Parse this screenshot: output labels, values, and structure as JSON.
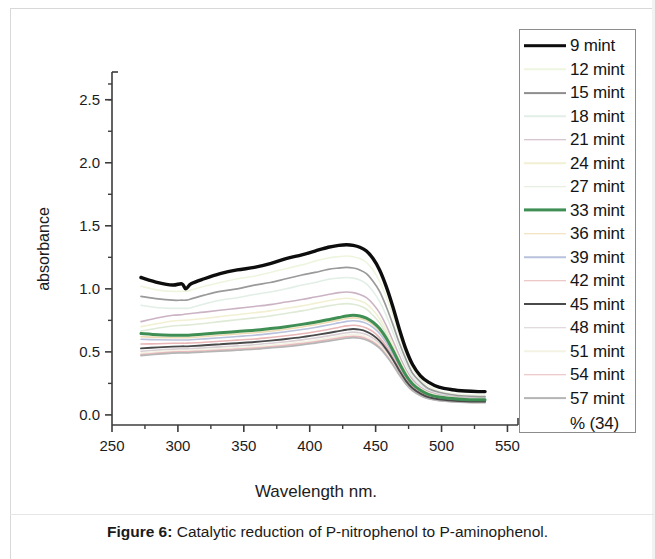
{
  "caption": {
    "figure_label": "Figure 6:",
    "text": " Catalytic reduction of P-nitrophenol to P-aminophenol."
  },
  "legend": {
    "note": "% (34)",
    "entries": [
      {
        "label": "9 mint",
        "color": "#0d0d0d",
        "width": 3.6
      },
      {
        "label": "12 mint",
        "color": "#eef5df",
        "width": 1.5
      },
      {
        "label": "15 mint",
        "color": "#8e8e8e",
        "width": 1.8
      },
      {
        "label": "18 mint",
        "color": "#e2efe6",
        "width": 1.5
      },
      {
        "label": "21 mint",
        "color": "#cbb3c4",
        "width": 1.5
      },
      {
        "label": "24 mint",
        "color": "#f2f0d2",
        "width": 1.5
      },
      {
        "label": "27 mint",
        "color": "#dfead6",
        "width": 1.5
      },
      {
        "label": "33 mint",
        "color": "#3f8f55",
        "width": 3.2
      },
      {
        "label": "36 mint",
        "color": "#f0dcb4",
        "width": 1.5
      },
      {
        "label": "39 mint",
        "color": "#b9c2dd",
        "width": 1.5
      },
      {
        "label": "42 mint",
        "color": "#e8b6b6",
        "width": 1.5
      },
      {
        "label": "45 mint",
        "color": "#4a4a4a",
        "width": 2.0
      },
      {
        "label": "48 mint",
        "color": "#d9cfd4",
        "width": 1.5
      },
      {
        "label": "51 mint",
        "color": "#f4f2e2",
        "width": 1.5
      },
      {
        "label": "54 mint",
        "color": "#e9b9bd",
        "width": 1.5
      },
      {
        "label": "57 mint",
        "color": "#b5b5b5",
        "width": 1.8
      }
    ]
  },
  "chart_data": {
    "type": "line",
    "title": "",
    "xlabel": "Wavelength nm.",
    "ylabel": "absorbance",
    "xlim": [
      250,
      558
    ],
    "ylim": [
      -0.08,
      2.72
    ],
    "xticks": [
      250,
      300,
      350,
      400,
      450,
      500,
      550
    ],
    "xticks_minor": [
      275,
      325,
      375,
      425,
      475,
      525
    ],
    "yticks": [
      0.0,
      0.5,
      1.0,
      1.5,
      2.0,
      2.5
    ],
    "yticks_minor": [
      0.25,
      0.75,
      1.25,
      1.75,
      2.25,
      2.5
    ],
    "grid": false,
    "legend_position": "right-outside",
    "x": [
      272,
      285,
      296,
      303,
      306,
      310,
      320,
      332,
      345,
      358,
      370,
      382,
      394,
      404,
      414,
      422,
      428,
      433,
      438,
      443,
      448,
      453,
      458,
      463,
      468,
      473,
      478,
      484,
      490,
      498,
      508,
      518,
      528,
      533
    ],
    "series": [
      {
        "name": "9 mint",
        "color": "#0d0d0d",
        "width": 3.4,
        "values": [
          1.09,
          1.05,
          1.03,
          1.04,
          1.0,
          1.04,
          1.08,
          1.12,
          1.15,
          1.17,
          1.2,
          1.24,
          1.27,
          1.3,
          1.33,
          1.345,
          1.35,
          1.345,
          1.33,
          1.3,
          1.24,
          1.15,
          1.02,
          0.86,
          0.68,
          0.52,
          0.4,
          0.31,
          0.26,
          0.22,
          0.2,
          0.19,
          0.185,
          0.185
        ]
      },
      {
        "name": "12 mint",
        "color": "#eef5df",
        "width": 1.6,
        "values": [
          1.02,
          0.99,
          0.98,
          0.98,
          0.98,
          0.99,
          1.02,
          1.05,
          1.08,
          1.1,
          1.13,
          1.16,
          1.19,
          1.22,
          1.245,
          1.255,
          1.26,
          1.255,
          1.24,
          1.21,
          1.15,
          1.06,
          0.94,
          0.79,
          0.63,
          0.48,
          0.37,
          0.28,
          0.23,
          0.19,
          0.17,
          0.16,
          0.155,
          0.155
        ]
      },
      {
        "name": "15 mint",
        "color": "#9a9a9a",
        "width": 1.7,
        "values": [
          0.94,
          0.92,
          0.91,
          0.91,
          0.91,
          0.92,
          0.95,
          0.98,
          1.0,
          1.03,
          1.05,
          1.08,
          1.11,
          1.13,
          1.155,
          1.165,
          1.17,
          1.165,
          1.15,
          1.12,
          1.06,
          0.98,
          0.86,
          0.72,
          0.57,
          0.44,
          0.33,
          0.26,
          0.21,
          0.18,
          0.16,
          0.15,
          0.145,
          0.145
        ]
      },
      {
        "name": "18 mint",
        "color": "#e2efe6",
        "width": 1.6,
        "values": [
          0.87,
          0.85,
          0.845,
          0.845,
          0.845,
          0.85,
          0.88,
          0.91,
          0.93,
          0.955,
          0.975,
          1.0,
          1.03,
          1.05,
          1.075,
          1.085,
          1.09,
          1.085,
          1.07,
          1.04,
          0.98,
          0.9,
          0.79,
          0.66,
          0.52,
          0.4,
          0.3,
          0.24,
          0.2,
          0.17,
          0.15,
          0.14,
          0.138,
          0.138
        ]
      },
      {
        "name": "21 mint",
        "color": "#cbb3c4",
        "width": 1.6,
        "values": [
          0.74,
          0.77,
          0.79,
          0.795,
          0.8,
          0.805,
          0.815,
          0.83,
          0.845,
          0.86,
          0.875,
          0.895,
          0.915,
          0.935,
          0.955,
          0.97,
          0.975,
          0.97,
          0.955,
          0.93,
          0.88,
          0.81,
          0.71,
          0.59,
          0.47,
          0.36,
          0.28,
          0.22,
          0.185,
          0.16,
          0.145,
          0.135,
          0.132,
          0.132
        ]
      },
      {
        "name": "24 mint",
        "color": "#f2f0d2",
        "width": 1.6,
        "values": [
          0.7,
          0.725,
          0.745,
          0.75,
          0.752,
          0.755,
          0.765,
          0.78,
          0.795,
          0.81,
          0.825,
          0.845,
          0.865,
          0.885,
          0.905,
          0.92,
          0.925,
          0.92,
          0.905,
          0.88,
          0.83,
          0.765,
          0.67,
          0.56,
          0.44,
          0.34,
          0.26,
          0.21,
          0.175,
          0.152,
          0.14,
          0.13,
          0.128,
          0.128
        ]
      },
      {
        "name": "27 mint",
        "color": "#dfead6",
        "width": 1.6,
        "values": [
          0.665,
          0.69,
          0.705,
          0.71,
          0.712,
          0.715,
          0.725,
          0.74,
          0.755,
          0.77,
          0.785,
          0.805,
          0.825,
          0.845,
          0.865,
          0.878,
          0.883,
          0.878,
          0.865,
          0.84,
          0.79,
          0.73,
          0.64,
          0.53,
          0.42,
          0.32,
          0.25,
          0.2,
          0.168,
          0.146,
          0.134,
          0.126,
          0.124,
          0.124
        ]
      },
      {
        "name": "33 mint",
        "color": "#3f8f55",
        "width": 3.0,
        "values": [
          0.645,
          0.635,
          0.632,
          0.632,
          0.632,
          0.634,
          0.642,
          0.652,
          0.662,
          0.672,
          0.685,
          0.7,
          0.718,
          0.735,
          0.755,
          0.772,
          0.785,
          0.79,
          0.785,
          0.768,
          0.735,
          0.685,
          0.61,
          0.515,
          0.41,
          0.315,
          0.245,
          0.195,
          0.163,
          0.142,
          0.13,
          0.122,
          0.12,
          0.12
        ]
      },
      {
        "name": "36 mint",
        "color": "#f0dcb4",
        "width": 1.6,
        "values": [
          0.62,
          0.615,
          0.612,
          0.612,
          0.612,
          0.614,
          0.622,
          0.632,
          0.642,
          0.652,
          0.665,
          0.68,
          0.698,
          0.715,
          0.735,
          0.752,
          0.765,
          0.77,
          0.765,
          0.748,
          0.715,
          0.665,
          0.59,
          0.5,
          0.398,
          0.305,
          0.238,
          0.19,
          0.158,
          0.138,
          0.126,
          0.119,
          0.117,
          0.117
        ]
      },
      {
        "name": "39 mint",
        "color": "#b9c2dd",
        "width": 1.6,
        "values": [
          0.6,
          0.596,
          0.594,
          0.594,
          0.594,
          0.596,
          0.603,
          0.612,
          0.622,
          0.632,
          0.645,
          0.66,
          0.677,
          0.694,
          0.713,
          0.73,
          0.742,
          0.747,
          0.742,
          0.726,
          0.694,
          0.645,
          0.573,
          0.485,
          0.385,
          0.296,
          0.231,
          0.184,
          0.154,
          0.134,
          0.123,
          0.116,
          0.114,
          0.114
        ]
      },
      {
        "name": "42 mint",
        "color": "#e8b6b6",
        "width": 1.6,
        "values": [
          0.562,
          0.565,
          0.568,
          0.569,
          0.569,
          0.57,
          0.576,
          0.584,
          0.593,
          0.602,
          0.614,
          0.628,
          0.644,
          0.66,
          0.678,
          0.694,
          0.706,
          0.711,
          0.706,
          0.69,
          0.66,
          0.613,
          0.545,
          0.461,
          0.366,
          0.281,
          0.22,
          0.176,
          0.147,
          0.128,
          0.118,
          0.112,
          0.11,
          0.11
        ]
      },
      {
        "name": "45 mint",
        "color": "#4a4a4a",
        "width": 1.9,
        "values": [
          0.528,
          0.536,
          0.542,
          0.544,
          0.544,
          0.546,
          0.552,
          0.56,
          0.569,
          0.578,
          0.589,
          0.602,
          0.617,
          0.633,
          0.65,
          0.665,
          0.676,
          0.681,
          0.676,
          0.661,
          0.632,
          0.587,
          0.522,
          0.442,
          0.351,
          0.27,
          0.211,
          0.169,
          0.141,
          0.124,
          0.114,
          0.108,
          0.106,
          0.106
        ]
      },
      {
        "name": "48 mint",
        "color": "#d9cfd4",
        "width": 1.6,
        "values": [
          0.505,
          0.515,
          0.522,
          0.524,
          0.524,
          0.526,
          0.532,
          0.54,
          0.548,
          0.557,
          0.568,
          0.58,
          0.595,
          0.61,
          0.627,
          0.641,
          0.652,
          0.657,
          0.652,
          0.637,
          0.609,
          0.566,
          0.503,
          0.426,
          0.338,
          0.26,
          0.203,
          0.163,
          0.136,
          0.12,
          0.11,
          0.105,
          0.103,
          0.103
        ]
      },
      {
        "name": "51 mint",
        "color": "#f4f2e2",
        "width": 1.6,
        "values": [
          0.49,
          0.5,
          0.508,
          0.51,
          0.51,
          0.512,
          0.518,
          0.525,
          0.533,
          0.542,
          0.552,
          0.564,
          0.578,
          0.593,
          0.609,
          0.623,
          0.633,
          0.638,
          0.633,
          0.619,
          0.592,
          0.55,
          0.489,
          0.414,
          0.329,
          0.253,
          0.198,
          0.159,
          0.133,
          0.117,
          0.108,
          0.103,
          0.101,
          0.101
        ]
      },
      {
        "name": "54 mint",
        "color": "#e9b9bd",
        "width": 1.6,
        "values": [
          0.478,
          0.49,
          0.498,
          0.5,
          0.5,
          0.502,
          0.507,
          0.514,
          0.522,
          0.53,
          0.54,
          0.552,
          0.566,
          0.58,
          0.596,
          0.609,
          0.619,
          0.624,
          0.619,
          0.605,
          0.579,
          0.538,
          0.478,
          0.405,
          0.322,
          0.248,
          0.194,
          0.156,
          0.131,
          0.115,
          0.106,
          0.101,
          0.099,
          0.099
        ]
      },
      {
        "name": "57 mint",
        "color": "#b5b5b5",
        "width": 1.7,
        "values": [
          0.47,
          0.482,
          0.49,
          0.492,
          0.492,
          0.494,
          0.499,
          0.506,
          0.513,
          0.521,
          0.531,
          0.542,
          0.556,
          0.57,
          0.585,
          0.598,
          0.608,
          0.613,
          0.608,
          0.594,
          0.569,
          0.529,
          0.47,
          0.398,
          0.316,
          0.244,
          0.191,
          0.153,
          0.129,
          0.113,
          0.104,
          0.099,
          0.097,
          0.097
        ]
      }
    ]
  }
}
